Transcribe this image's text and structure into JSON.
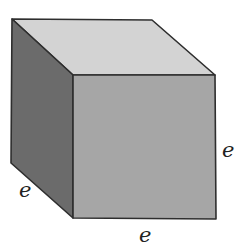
{
  "figure": {
    "type": "cube",
    "colors": {
      "top_face": "#d3d3d3",
      "left_face": "#6b6b6b",
      "front_face": "#a6a6a6",
      "edge": "#2e2e2e"
    },
    "labels": {
      "left_edge": "e",
      "bottom_edge": "e",
      "right_edge": "e"
    }
  }
}
